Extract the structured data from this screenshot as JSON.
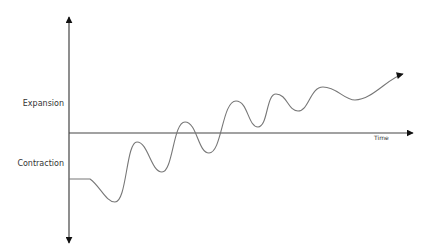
{
  "diagram": {
    "type": "business-cycle",
    "labels": {
      "expansion": "Expansion",
      "contraction": "Contraction",
      "time": "Time"
    },
    "axes": {
      "vertical": {
        "x": 69,
        "top": 17,
        "bottom": 243,
        "arrows": "both"
      },
      "horizontal": {
        "y": 133,
        "left": 69,
        "right": 413,
        "arrow": "end"
      }
    },
    "colors": {
      "axis": "#444444",
      "curve": "#777777",
      "arrowhead": "#111111",
      "text": "#333333"
    },
    "curve_points": [
      {
        "x": 69,
        "y": 179
      },
      {
        "x": 90,
        "y": 179
      },
      {
        "x": 115,
        "y": 202
      },
      {
        "x": 137,
        "y": 142
      },
      {
        "x": 162,
        "y": 172
      },
      {
        "x": 185,
        "y": 122
      },
      {
        "x": 209,
        "y": 153
      },
      {
        "x": 236,
        "y": 101
      },
      {
        "x": 258,
        "y": 127
      },
      {
        "x": 276,
        "y": 94
      },
      {
        "x": 298,
        "y": 111
      },
      {
        "x": 323,
        "y": 87
      },
      {
        "x": 355,
        "y": 100
      },
      {
        "x": 403,
        "y": 74
      }
    ]
  }
}
